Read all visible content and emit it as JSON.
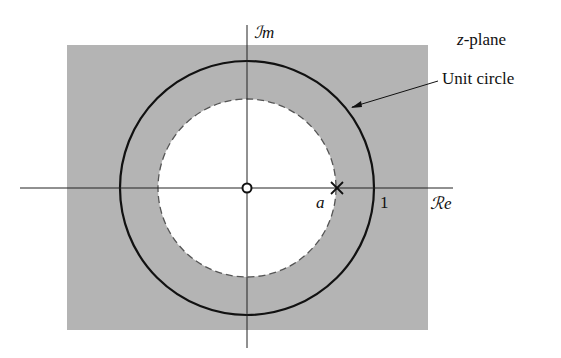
{
  "diagram": {
    "plane_label": "z-plane",
    "plane_label_var": "z",
    "plane_label_suffix": "-plane",
    "imag_axis_label": "ℐm",
    "real_axis_label": "ℛe",
    "unit_circle_label": "Unit circle",
    "pole_label": "a",
    "unit_tick_label": "1",
    "colors": {
      "roc_fill": "#b4b4b4",
      "axis": "#222222",
      "circle": "#111111",
      "dashed_circle": "#444444",
      "background": "#ffffff"
    },
    "elements": {
      "zero": {
        "symbol": "o",
        "position": "origin"
      },
      "pole": {
        "symbol": "x",
        "position": "z = a"
      },
      "roc": "region outside |z| = a (shaded), excluding disc of radius a"
    }
  }
}
